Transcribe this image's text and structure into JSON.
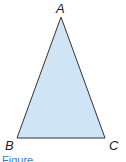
{
  "diagram": {
    "type": "triangle",
    "fill_color": "#cfe4f5",
    "stroke_color": "#333333",
    "vertices": [
      {
        "label": "A",
        "x": 61,
        "y": 17
      },
      {
        "label": "B",
        "x": 17,
        "y": 138
      },
      {
        "label": "C",
        "x": 105,
        "y": 138
      }
    ],
    "labels": {
      "a": "A",
      "b": "B",
      "c": "C"
    }
  },
  "caption": {
    "text": "Figure",
    "color": "#3a7ec8"
  }
}
